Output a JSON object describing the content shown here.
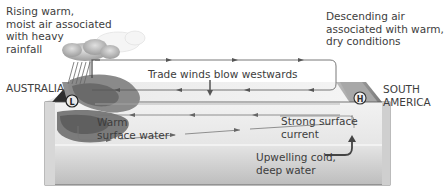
{
  "diagram": {
    "labels": {
      "rising_air": [
        "Rising warm,",
        "moist air associated",
        "with heavy",
        "rainfall"
      ],
      "descending_air": [
        "Descending air",
        "associated with warm,",
        "dry conditions"
      ],
      "trade_winds": "Trade winds blow westwards",
      "australia": "AUSTRALIA",
      "south_america": [
        "SOUTH",
        "AMERICA"
      ],
      "warm_water": [
        "Warm",
        "surface water"
      ],
      "strong_current": [
        "Strong surface",
        "current"
      ],
      "upwelling": [
        "Upwelling cold,",
        "deep water"
      ],
      "low_pressure_symbol": "L",
      "high_pressure_symbol": "H"
    },
    "colors": {
      "ocean_light": "#e4e4e4",
      "ocean_mid": "#cfcfcf",
      "warm_water_dark": "#6a6a6a",
      "warm_water_mid": "#8c8c8c",
      "land_dark": "#2e2e2e",
      "land_light": "#9a9a9a",
      "arrow": "#555555",
      "text": "#3d3d3d"
    }
  }
}
